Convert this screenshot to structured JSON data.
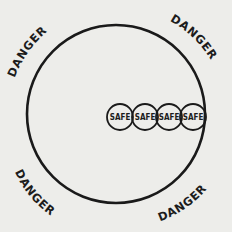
{
  "diagram": {
    "outer_circle": {
      "cx": 116,
      "cy": 114,
      "r": 90,
      "stroke": "#1a1a1a",
      "stroke_width": 2.5
    },
    "danger_labels": [
      {
        "text": "DANGER",
        "position": "top-left"
      },
      {
        "text": "DANGER",
        "position": "top-right"
      },
      {
        "text": "DANGER",
        "position": "bottom-left"
      },
      {
        "text": "DANGER",
        "position": "bottom-right"
      }
    ],
    "safe_circles": [
      {
        "text": "SAFE",
        "cx": 120,
        "cy": 117,
        "r": 13
      },
      {
        "text": "SAFE",
        "cx": 145,
        "cy": 117,
        "r": 13
      },
      {
        "text": "SAFE",
        "cx": 169,
        "cy": 117,
        "r": 13
      },
      {
        "text": "SAFE",
        "cx": 193,
        "cy": 117,
        "r": 13
      }
    ],
    "colors": {
      "background": "#ededea",
      "ink": "#1a1a1a"
    }
  }
}
